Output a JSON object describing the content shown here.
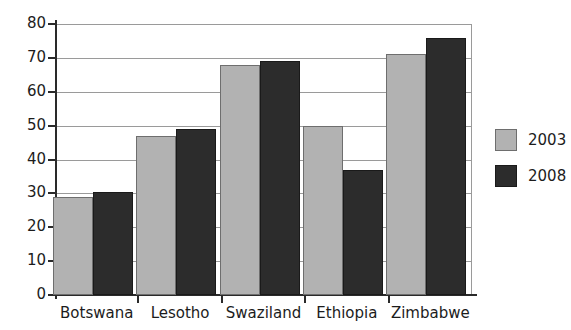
{
  "chart_data": {
    "type": "bar",
    "title": "",
    "subtitle": "",
    "xlabel": "",
    "ylabel": "",
    "categories": [
      "Botswana",
      "Lesotho",
      "Swaziland",
      "Ethiopia",
      "Zimbabwe"
    ],
    "series": [
      {
        "name": "2003",
        "color": "#b2b2b2",
        "values": [
          29,
          47,
          68,
          50,
          71
        ]
      },
      {
        "name": "2008",
        "color": "#2c2c2c",
        "values": [
          30.5,
          49,
          69,
          37,
          76
        ]
      }
    ],
    "ylim": [
      0,
      80
    ],
    "ytick_step": 10,
    "yticks": [
      0,
      10,
      20,
      30,
      40,
      50,
      60,
      70,
      80
    ],
    "ytick_labels": [
      "0",
      "10",
      "20",
      "30",
      "40",
      "50",
      "60",
      "70",
      "80"
    ],
    "grid": true,
    "grid_axis": "y",
    "legend": true,
    "legend_position": "right",
    "legend_entries": [
      "2003",
      "2008"
    ],
    "annotations": []
  }
}
